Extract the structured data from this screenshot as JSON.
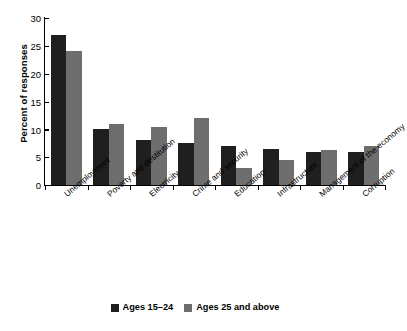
{
  "chart_data": {
    "type": "bar",
    "title": "",
    "xlabel": "",
    "ylabel": "Percent of responses",
    "ylim": [
      0,
      30
    ],
    "yticks": [
      0,
      5,
      10,
      15,
      20,
      25,
      30
    ],
    "grid": false,
    "legend_position": "bottom",
    "categories": [
      "Unemployment",
      "Poverty and destitution",
      "Electricity",
      "Crime and security",
      "Education",
      "Infrastructure",
      "Management of the economy",
      "Corruption"
    ],
    "series": [
      {
        "name": "Ages 15–24",
        "color": "#1f1f1f",
        "values": [
          27,
          10,
          8,
          7.5,
          7,
          6.5,
          6,
          6
        ]
      },
      {
        "name": "Ages 25 and above",
        "color": "#6e6e6e",
        "values": [
          24,
          11,
          10.5,
          12,
          3,
          4.5,
          6.3,
          7
        ]
      }
    ]
  },
  "legend": {
    "items": [
      {
        "label": "Ages 15–24",
        "color": "#1f1f1f"
      },
      {
        "label": "Ages 25 and above",
        "color": "#6e6e6e"
      }
    ]
  },
  "axis": {
    "y_title": "Percent of responses",
    "y_tick_labels": [
      "0",
      "5",
      "10",
      "15",
      "20",
      "25",
      "30"
    ]
  }
}
